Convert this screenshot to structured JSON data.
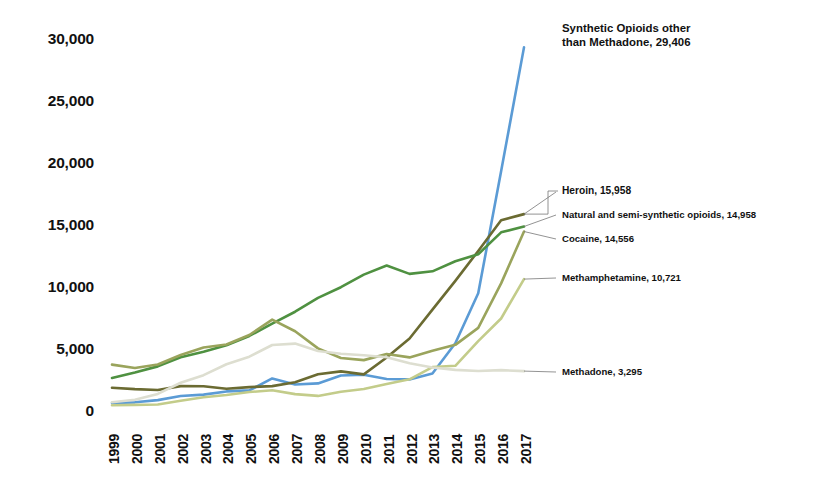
{
  "chart_data": {
    "type": "line",
    "title": "",
    "subtitle": "",
    "xlabel": "",
    "ylabel": "",
    "grid": false,
    "legend_position": "inline-right-annotations",
    "x": [
      1999,
      2000,
      2001,
      2002,
      2003,
      2004,
      2005,
      2006,
      2007,
      2008,
      2009,
      2010,
      2011,
      2012,
      2013,
      2014,
      2015,
      2016,
      2017
    ],
    "xtick_labels": [
      "1999",
      "2000",
      "2001",
      "2002",
      "2003",
      "2004",
      "2005",
      "2006",
      "2007",
      "2008",
      "2009",
      "2010",
      "2011",
      "2012",
      "2013",
      "2014",
      "2015",
      "2016",
      "2017"
    ],
    "ytick_labels": [
      "0",
      "5,000",
      "10,000",
      "15,000",
      "20,000",
      "25,000",
      "30,000"
    ],
    "ytick_values": [
      0,
      5000,
      10000,
      15000,
      20000,
      25000,
      30000
    ],
    "ylim": [
      0,
      30000
    ],
    "xlim": [
      1999,
      2017
    ],
    "series": [
      {
        "name": "Synthetic Opioids other than Methadone",
        "color": "#5b9bd5",
        "end_value": 29406,
        "values": [
          730,
          780,
          960,
          1290,
          1400,
          1660,
          1742,
          2707,
          2213,
          2306,
          2946,
          3007,
          2666,
          2628,
          3105,
          5544,
          9580,
          19413,
          29406
        ]
      },
      {
        "name": "Heroin",
        "color": "#6b6b32",
        "end_value": 15958,
        "values": [
          1960,
          1842,
          1779,
          2089,
          2080,
          1878,
          2009,
          2088,
          2399,
          3041,
          3278,
          3036,
          4397,
          5925,
          8257,
          10574,
          12989,
          15469,
          15958
        ]
      },
      {
        "name": "Natural and semi-synthetic opioids",
        "color": "#4f9141",
        "end_value": 14958,
        "values": [
          2749,
          3190,
          3680,
          4416,
          4866,
          5378,
          6132,
          7124,
          8086,
          9202,
          10064,
          11076,
          11820,
          11140,
          11345,
          12159,
          12727,
          14487,
          14958
        ]
      },
      {
        "name": "Cocaine",
        "color": "#9aa45c",
        "end_value": 14556,
        "values": [
          3822,
          3544,
          3833,
          4599,
          5196,
          5443,
          6208,
          7448,
          6512,
          5129,
          4350,
          4183,
          4681,
          4404,
          4944,
          5415,
          6784,
          10375,
          14556
        ]
      },
      {
        "name": "Methamphetamine",
        "color": "#c3cc8a",
        "end_value": 10721,
        "values": [
          547,
          573,
          606,
          904,
          1192,
          1371,
          1608,
          1755,
          1441,
          1297,
          1632,
          1854,
          2266,
          2635,
          3627,
          3728,
          5716,
          7542,
          10721
        ]
      },
      {
        "name": "Methadone",
        "color": "#ddded0",
        "end_value": 3295,
        "values": [
          786,
          988,
          1456,
          2360,
          2972,
          3849,
          4462,
          5406,
          5518,
          4924,
          4694,
          4577,
          4418,
          3932,
          3591,
          3400,
          3301,
          3373,
          3295
        ]
      }
    ],
    "annotations": [
      {
        "label": "Synthetic Opioids other\nthan Methadone, 29,406",
        "series": "Synthetic Opioids other than Methadone",
        "value": 29406
      },
      {
        "label": "Heroin, 15,958",
        "series": "Heroin",
        "value": 15958
      },
      {
        "label": "Natural and semi-synthetic  opioids, 14,958",
        "series": "Natural and semi-synthetic opioids",
        "value": 14958
      },
      {
        "label": "Cocaine, 14,556",
        "series": "Cocaine",
        "value": 14556
      },
      {
        "label": "Methamphetamine,  10,721",
        "series": "Methamphetamine",
        "value": 10721
      },
      {
        "label": "Methadone, 3,295",
        "series": "Methadone",
        "value": 3295
      }
    ]
  },
  "annotation_text": {
    "synthetic_line1": "Synthetic Opioids other",
    "synthetic_line2": "than Methadone, 29,406",
    "heroin": "Heroin, 15,958",
    "natural": "Natural and semi-synthetic  opioids, 14,958",
    "cocaine": "Cocaine, 14,556",
    "methamphetamine": "Methamphetamine,  10,721",
    "methadone": "Methadone, 3,295"
  },
  "colors": {
    "synthetic_opioids": "#5b9bd5",
    "heroin": "#6b6b32",
    "natural_opioids": "#4f9141",
    "cocaine": "#9aa45c",
    "methamphetamine": "#c3cc8a",
    "methadone": "#ddded0",
    "text": "#111111",
    "background": "#ffffff"
  }
}
